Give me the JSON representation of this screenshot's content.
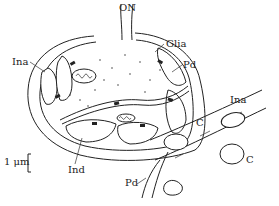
{
  "diagram": {
    "labels": {
      "optic_nerve": "ON",
      "glia": "Glia",
      "pd_top": "Pd",
      "ina_left": "Ina",
      "ina_right": "Ina",
      "ind": "Ind",
      "c_upper": "C",
      "c_lower": "C",
      "pd_bottom": "Pd",
      "scale_bar": "1 μm"
    },
    "colors": {
      "line": "#222222",
      "stipple_fill": "#cfcfcf",
      "background": "#ffffff"
    }
  }
}
